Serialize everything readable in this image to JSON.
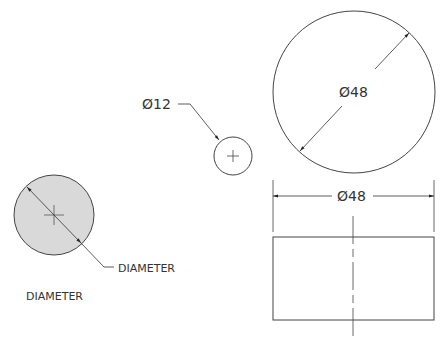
{
  "diagram": {
    "left_circle": {
      "leader_label": "DIAMETER",
      "caption": "DIAMETER",
      "fill": "#d9d9d9"
    },
    "small_circle": {
      "label": "Ø12"
    },
    "large_circle": {
      "label": "Ø48"
    },
    "side_view": {
      "label": "Ø48"
    },
    "line_color": "#333333"
  }
}
